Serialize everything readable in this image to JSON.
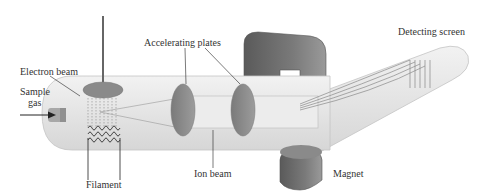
{
  "labels": {
    "electron_beam": "Electron beam",
    "sample_gas_line1": "Sample",
    "sample_gas_line2": "gas",
    "accelerating_plates": "Accelerating plates",
    "detecting_screen": "Detecting screen",
    "filament": "Filament",
    "ion_beam": "Ion beam",
    "magnet": "Magnet"
  },
  "colors": {
    "tube": "#e6e6e6",
    "tube_edge": "#c8c8c8",
    "plate": "#8a8a8a",
    "magnet": "#6a6a6a",
    "beam_lines": "#9a9a9a",
    "text": "#333333"
  }
}
